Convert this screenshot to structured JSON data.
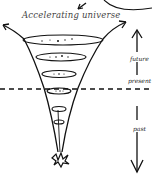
{
  "diagram": {
    "title": "Accelerating universe",
    "labels": {
      "future": "future",
      "present": "present",
      "past": "past"
    },
    "elements": [
      "funnel-cone",
      "expansion-arrows",
      "cross-section-rings",
      "present-dashed-line",
      "time-arrow-up",
      "time-arrow-down",
      "big-bang-burst",
      "partial-circle-arrow"
    ],
    "colors": {
      "ink": "#111111",
      "background": "#ffffff",
      "title": "#444444"
    }
  }
}
